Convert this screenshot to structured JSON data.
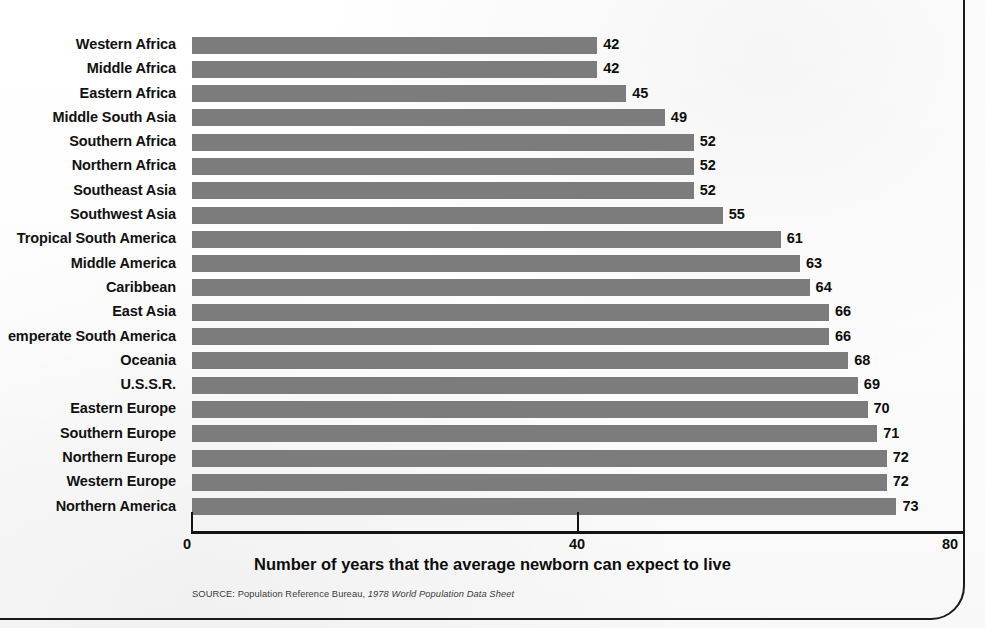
{
  "chart_data": {
    "type": "bar",
    "orientation": "horizontal",
    "title": "",
    "xlabel": "Number of years that the average newborn can expect to live",
    "ylabel": "",
    "xlim": [
      0,
      80
    ],
    "xticks": [
      0,
      40,
      80
    ],
    "xtick_labels": [
      "0",
      "40",
      "80"
    ],
    "grid": false,
    "legend": null,
    "bar_color": "#7c7c7c",
    "categories": [
      "Western Africa",
      "Middle Africa",
      "Eastern Africa",
      "Middle South Asia",
      "Southern Africa",
      "Northern Africa",
      "Southeast Asia",
      "Southwest Asia",
      "Tropical South America",
      "Middle America",
      "Caribbean",
      "East Asia",
      "Temperate South America",
      "Oceania",
      "U.S.S.R.",
      "Eastern Europe",
      "Southern Europe",
      "Northern Europe",
      "Western Europe",
      "Northern America"
    ],
    "category_display": [
      "Western Africa",
      "Middle Africa",
      "Eastern Africa",
      "Middle South Asia",
      "Southern Africa",
      "Northern Africa",
      "Southeast Asia",
      "Southwest Asia",
      "Tropical South America",
      "Middle America",
      "Caribbean",
      "East Asia",
      "emperate South America",
      "Oceania",
      "U.S.S.R.",
      "Eastern Europe",
      "Southern Europe",
      "Northern Europe",
      "Western Europe",
      "Northern America"
    ],
    "values": [
      42,
      42,
      45,
      49,
      52,
      52,
      52,
      55,
      61,
      63,
      64,
      66,
      66,
      68,
      69,
      70,
      71,
      72,
      72,
      73
    ],
    "value_labels": [
      "42",
      "42",
      "45",
      "49",
      "52",
      "52",
      "52",
      "55",
      "61",
      "63",
      "64",
      "66",
      "66",
      "68",
      "69",
      "70",
      "71",
      "72",
      "72",
      "73"
    ]
  },
  "footnote": {
    "prefix": "SOURCE: Population Reference Bureau, ",
    "title": "1978 World Population Data Sheet"
  }
}
